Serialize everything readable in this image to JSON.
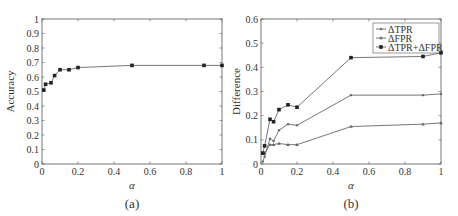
{
  "chart_data": [
    {
      "type": "line",
      "caption": "(a)",
      "title": "",
      "xlabel": "α",
      "ylabel": "Accuracy",
      "xlim": [
        0,
        1
      ],
      "ylim": [
        0,
        1
      ],
      "xticks": [
        "0",
        "0.2",
        "0.4",
        "0.6",
        "0.8",
        "1"
      ],
      "yticks": [
        "0",
        "0.1",
        "0.2",
        "0.3",
        "0.4",
        "0.5",
        "0.6",
        "0.7",
        "0.8",
        "0.9",
        "1"
      ],
      "grid": false,
      "x": [
        0.01,
        0.02,
        0.05,
        0.07,
        0.1,
        0.15,
        0.2,
        0.5,
        0.9,
        1.0
      ],
      "series": [
        {
          "name": "Accuracy",
          "marker": "square",
          "values": [
            0.51,
            0.55,
            0.56,
            0.61,
            0.65,
            0.65,
            0.665,
            0.68,
            0.68,
            0.68
          ]
        }
      ]
    },
    {
      "type": "line",
      "caption": "(b)",
      "title": "",
      "xlabel": "α",
      "ylabel": "Difference",
      "xlim": [
        0,
        1
      ],
      "ylim": [
        0,
        0.6
      ],
      "xticks": [
        "0",
        "0.2",
        "0.4",
        "0.6",
        "0.8",
        "1"
      ],
      "yticks": [
        "0",
        "0.1",
        "0.2",
        "0.3",
        "0.4",
        "0.5",
        "0.6"
      ],
      "grid": false,
      "legend_position": "top-right",
      "x": [
        0.01,
        0.02,
        0.05,
        0.07,
        0.1,
        0.15,
        0.2,
        0.5,
        0.9,
        1.0
      ],
      "series": [
        {
          "name": "ΔTPR",
          "marker": "dot",
          "values": [
            0.01,
            0.03,
            0.105,
            0.095,
            0.14,
            0.165,
            0.16,
            0.285,
            0.285,
            0.29
          ]
        },
        {
          "name": "ΔFPR",
          "marker": "triangle",
          "values": [
            0.045,
            0.045,
            0.08,
            0.08,
            0.085,
            0.08,
            0.08,
            0.155,
            0.165,
            0.17
          ]
        },
        {
          "name": "ΔTPR+ΔFPR",
          "marker": "square",
          "values": [
            0.045,
            0.075,
            0.185,
            0.175,
            0.225,
            0.245,
            0.235,
            0.44,
            0.445,
            0.46
          ]
        }
      ]
    }
  ],
  "colors": {
    "axis": "#555555",
    "line": "#555555",
    "marker": "#222222",
    "text": "#333333"
  }
}
